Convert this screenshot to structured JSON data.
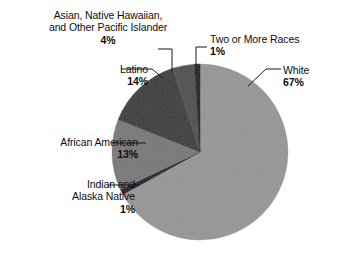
{
  "chart_data": {
    "type": "pie",
    "title": "",
    "unit": "%",
    "legend_position": "callout-labels",
    "start_angle_deg": 0,
    "direction": "clockwise",
    "categories": [
      "White",
      "Indian and Alaska Native",
      "African American",
      "Latino",
      "Asian, Native Hawaiian, and Other Pacific Islander",
      "Two or More Races"
    ],
    "values": [
      67,
      1,
      13,
      14,
      4,
      1
    ],
    "slices": [
      {
        "label": "White",
        "value": 67,
        "pct_text": "67%",
        "color": "#969696"
      },
      {
        "label": "Indian and Alaska Native",
        "value": 1,
        "pct_text": "1%",
        "color": "#131313"
      },
      {
        "label": "African American",
        "value": 13,
        "pct_text": "13%",
        "color": "#787878"
      },
      {
        "label": "Latino",
        "value": 14,
        "pct_text": "14%",
        "color": "#3a3a3a"
      },
      {
        "label": "Asian, Native Hawaiian, and Other Pacific Islander",
        "value": 4,
        "pct_text": "4%",
        "color": "#4e4e4e"
      },
      {
        "label": "Two or More Races",
        "value": 1,
        "pct_text": "1%",
        "color": "#131313"
      }
    ]
  },
  "labels": {
    "asian": {
      "line1": "Asian, Native Hawaiian,",
      "line2": "and Other Pacific Islander",
      "pct": "4%"
    },
    "two_or_more": {
      "line1": "Two or More Races",
      "pct": "1%"
    },
    "white": {
      "line1": "White",
      "pct": "67%"
    },
    "latino": {
      "line1": "Latino",
      "pct": "14%"
    },
    "african_american": {
      "line1": "African American",
      "pct": "13%"
    },
    "indian_alaska": {
      "line1": "Indian and",
      "line2": "Alaska Native",
      "pct": "1%"
    }
  },
  "colors": {
    "background": "#ffffff",
    "text": "#0d0d0d",
    "leader_line": "#1a1a1a",
    "white_slice": "#969696",
    "african_american_slice": "#787878",
    "latino_slice": "#3a3a3a",
    "asian_slice": "#4e4e4e",
    "dark_sliver": "#131313"
  }
}
